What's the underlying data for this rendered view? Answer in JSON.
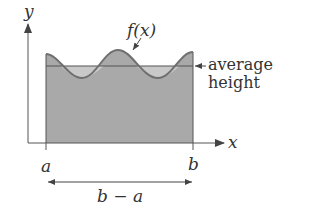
{
  "diagram": {
    "type": "mean-value-of-integral",
    "labels": {
      "y_axis": "y",
      "x_axis": "x",
      "function": "f(x)",
      "average_line_1": "average",
      "average_line_2": "height",
      "left_bound": "a",
      "right_bound": "b",
      "width": "b − a"
    },
    "colors": {
      "fill_under_curve": "#a9a9a9",
      "fill_above_average": "#c9c9c9",
      "curve": "#6f6f6f",
      "axes": "#555555",
      "text": "#333333"
    }
  }
}
